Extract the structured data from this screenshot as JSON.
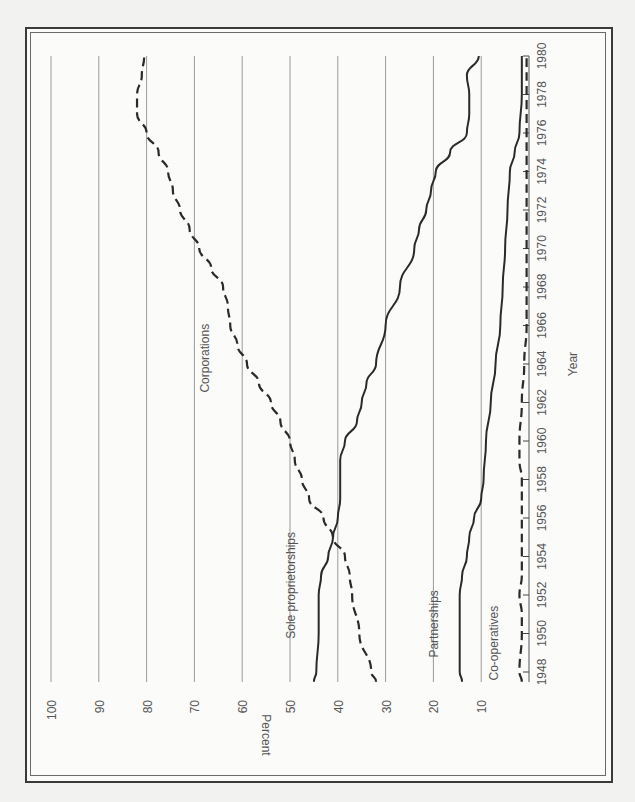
{
  "chart_data": {
    "type": "line",
    "title": "",
    "orientation": "rotated 90° clockwise (year axis runs along right edge, bottom-to-top)",
    "xlabel": "Year",
    "ylabel": "Percent",
    "xlim": [
      1948,
      1980
    ],
    "ylim": [
      0,
      100
    ],
    "grid": true,
    "legend": "inline labels",
    "x_tick_labels": [
      "1948",
      "1950",
      "1952",
      "1954",
      "1956",
      "1958",
      "1960",
      "1962",
      "1964",
      "1966",
      "1968",
      "1970",
      "1972",
      "1974",
      "1976",
      "1978",
      "1980"
    ],
    "y_tick_labels": [
      "10",
      "20",
      "30",
      "40",
      "50",
      "60",
      "70",
      "80",
      "90",
      "100"
    ],
    "series": [
      {
        "name": "Corporations",
        "style": "dashed",
        "x": [
          1947.5,
          1948,
          1950,
          1952,
          1953,
          1954,
          1955,
          1956,
          1957,
          1958,
          1959,
          1960,
          1961,
          1962,
          1963,
          1964,
          1965,
          1966,
          1967,
          1968,
          1969,
          1970,
          1971,
          1972,
          1973,
          1974,
          1975,
          1976,
          1977,
          1978,
          1979,
          1980
        ],
        "values": [
          32,
          33,
          35.5,
          37,
          37.5,
          38.5,
          41,
          43,
          46,
          47.5,
          49,
          50,
          52,
          54,
          56.5,
          59,
          61,
          62.5,
          63,
          64,
          66.5,
          69,
          71,
          73,
          74.5,
          75.5,
          77.5,
          80,
          82,
          82,
          81,
          80.5
        ]
      },
      {
        "name": "Sole proprietorships",
        "style": "solid",
        "x": [
          1947.5,
          1948,
          1950,
          1952,
          1953,
          1954,
          1955,
          1956,
          1957,
          1958,
          1959,
          1960,
          1961,
          1962,
          1963,
          1964,
          1966,
          1968,
          1970,
          1971,
          1972,
          1973,
          1974,
          1975,
          1976,
          1977,
          1978,
          1979,
          1980
        ],
        "values": [
          45,
          44.5,
          44,
          44,
          43.5,
          42,
          41,
          40,
          39.5,
          39.5,
          39.5,
          38.5,
          36,
          35,
          34,
          32,
          30,
          27,
          24,
          23,
          21.5,
          20.5,
          19.5,
          16.5,
          13,
          12.5,
          12.5,
          13,
          10.5
        ]
      },
      {
        "name": "Partnerships",
        "style": "solid",
        "x": [
          1947.5,
          1948,
          1950,
          1952,
          1953,
          1954,
          1955,
          1956,
          1957,
          1958,
          1960,
          1962,
          1964,
          1966,
          1968,
          1970,
          1972,
          1974,
          1975,
          1976,
          1978,
          1980
        ],
        "values": [
          14,
          14.5,
          14.5,
          14.5,
          14,
          13,
          12.5,
          11.5,
          10,
          9.5,
          9,
          8,
          7,
          6,
          5.5,
          5,
          4.5,
          4,
          3,
          2,
          1.5,
          1.5
        ]
      },
      {
        "name": "Co-operatives",
        "style": "dashed",
        "x": [
          1947.5,
          1948,
          1950,
          1951,
          1952,
          1953,
          1954,
          1956,
          1958,
          1959,
          1960,
          1962,
          1964,
          1966,
          1968,
          1970,
          1972,
          1974,
          1976,
          1978,
          1980
        ],
        "values": [
          1.5,
          2,
          1.5,
          1.5,
          2,
          1.5,
          1.5,
          1.5,
          1.5,
          2,
          2,
          1.5,
          1,
          0.5,
          0.5,
          0.5,
          0.5,
          0.5,
          0.5,
          0.5,
          0.5
        ]
      }
    ],
    "annotations": [
      {
        "text": "Corporations",
        "year": 1964.3,
        "pct": 67
      },
      {
        "text": "Sole proprietorships",
        "year": 1952.5,
        "pct": 49
      },
      {
        "text": "Partnerships",
        "year": 1950.5,
        "pct": 19
      },
      {
        "text": "Co-operatives",
        "year": 1949.5,
        "pct": 6.5
      }
    ]
  },
  "axes": {
    "x_title": "Year",
    "y_title": "Percent"
  }
}
